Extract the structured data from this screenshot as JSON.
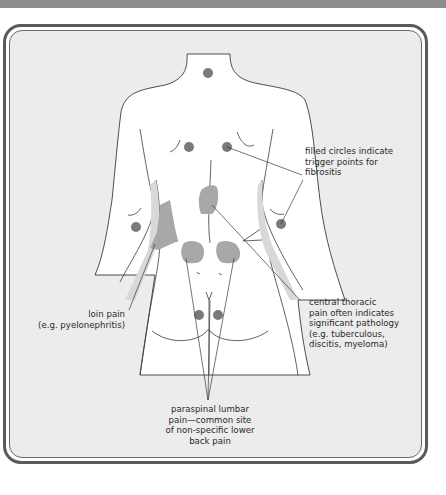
{
  "figure": {
    "colors": {
      "panel_background": "#ececec",
      "panel_border": "#5a5a5a",
      "body_fill": "#ffffff",
      "outline": "#3a3a3a",
      "trigger_point": "#7a7a7a",
      "pain_area": "#a8a8a8",
      "shadow_band": "#d8d8d8",
      "top_bar": "#8d8d8d"
    },
    "legend": {
      "trigger_points": "filled circles indicate\ntrigger points for\nfibrositis"
    },
    "annotations": {
      "loin_pain": "loin pain\n(e.g. pyelonephritis)",
      "central_thoracic": "central thoracic\npain often indicates\nsignificant pathology\n(e.g. tuberculous,\ndiscitis, myeloma)",
      "paraspinal_lumbar": "paraspinal lumbar\npain—common site\nof non-specific lower\nback pain"
    },
    "trigger_points": [
      {
        "name": "neck",
        "x": 208,
        "y": 73
      },
      {
        "name": "left-scapula",
        "x": 189,
        "y": 147
      },
      {
        "name": "right-scapula",
        "x": 227,
        "y": 147
      },
      {
        "name": "left-elbow",
        "x": 136,
        "y": 227
      },
      {
        "name": "right-elbow",
        "x": 281,
        "y": 224
      },
      {
        "name": "left-buttock",
        "x": 199,
        "y": 315
      },
      {
        "name": "right-buttock",
        "x": 218,
        "y": 315
      }
    ],
    "pain_areas": [
      {
        "name": "central-thoracic"
      },
      {
        "name": "loin"
      },
      {
        "name": "left-paraspinal-lumbar"
      },
      {
        "name": "right-paraspinal-lumbar"
      }
    ]
  }
}
